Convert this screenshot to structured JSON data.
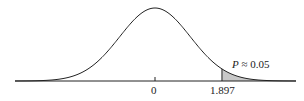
{
  "chart_data": {
    "type": "area",
    "title": "",
    "xlabel": "",
    "ylabel": "",
    "tick_labels": [
      "0",
      "1.897"
    ],
    "x_ticks": [
      0,
      1.897
    ],
    "shaded_region": {
      "from": 1.897,
      "to": "infinity",
      "color": "#c8c8c8"
    },
    "annotation": {
      "symbol": "P",
      "relation": "≈",
      "value": "0.05"
    },
    "grid": false,
    "legend": null
  },
  "labels": {
    "zero": "0",
    "crit": "1.897",
    "p_symbol": "P",
    "p_rest": " ≈ 0.05"
  }
}
